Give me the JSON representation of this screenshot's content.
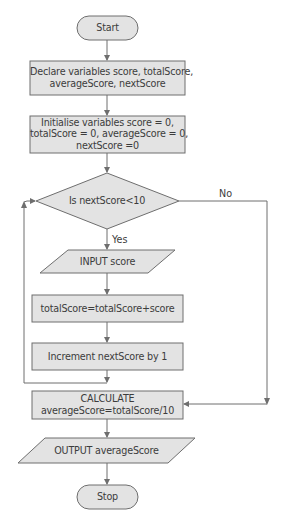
{
  "diagram": {
    "type": "flowchart",
    "colors": {
      "fill": "#e3e3e3",
      "stroke": "#6e6e6e",
      "text": "#3c3c3c"
    },
    "nodes": {
      "start": {
        "shape": "terminator",
        "text": "Start"
      },
      "declare": {
        "shape": "process",
        "line1": "Declare variables score, totalScore,",
        "line2": "averageScore, nextScore"
      },
      "initialise": {
        "shape": "process",
        "line1": "Initialise variables score = 0,",
        "line2": "totalScore = 0,  averageScore = 0,",
        "line3": "nextScore =0"
      },
      "decision": {
        "shape": "decision",
        "text": "Is nextScore<10"
      },
      "input": {
        "shape": "input-output",
        "text": "INPUT score"
      },
      "total": {
        "shape": "process",
        "text": "totalScore=totalScore+score"
      },
      "increment": {
        "shape": "process",
        "text": "Increment nextScore by 1"
      },
      "calculate": {
        "shape": "process",
        "line1": "CALCULATE",
        "line2": "averageScore=totalScore/10"
      },
      "output": {
        "shape": "input-output",
        "text": "OUTPUT averageScore"
      },
      "stop": {
        "shape": "terminator",
        "text": "Stop"
      }
    },
    "edges": {
      "yes": "Yes",
      "no": "No"
    },
    "connections": [
      [
        "start",
        "declare"
      ],
      [
        "declare",
        "initialise"
      ],
      [
        "initialise",
        "decision"
      ],
      [
        "decision",
        "input",
        "Yes"
      ],
      [
        "decision",
        "calculate",
        "No"
      ],
      [
        "input",
        "total"
      ],
      [
        "total",
        "increment"
      ],
      [
        "increment",
        "decision"
      ],
      [
        "calculate",
        "output"
      ],
      [
        "output",
        "stop"
      ]
    ]
  }
}
